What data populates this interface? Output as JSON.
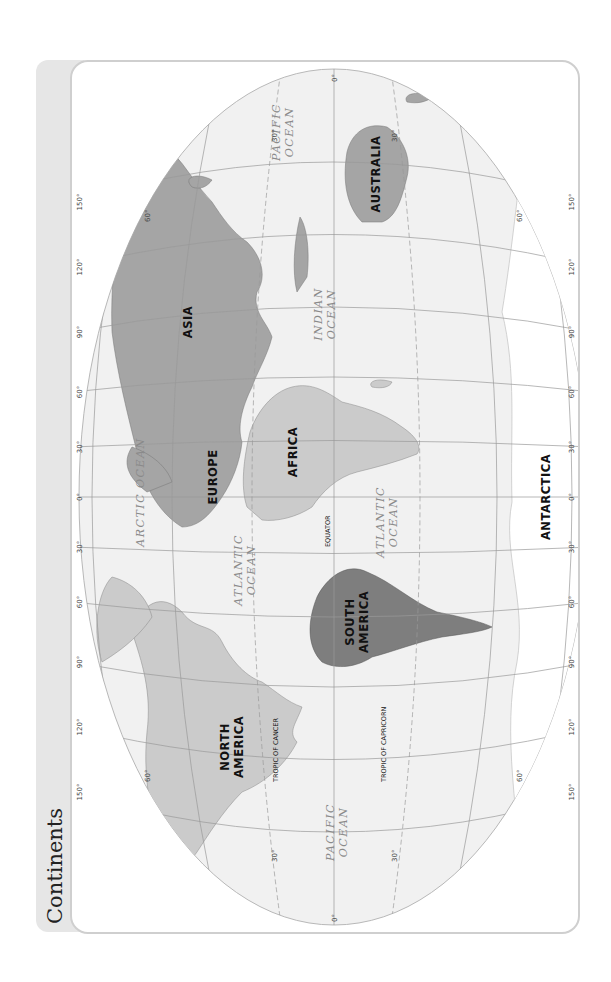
{
  "header": {
    "title": "Continents"
  },
  "colors": {
    "tab_background": "#e6e6e6",
    "panel_border": "#cfcfcf",
    "ocean": "#f1f1f1",
    "graticule": "#9a9a9a",
    "asia_europe_australia": "#a5a5a5",
    "north_america_africa": "#cbcbcb",
    "south_america": "#7e7e7e",
    "antarctica": "#ffffff"
  },
  "map": {
    "orientation": "rotated 90 degrees counter-clockwise (north points left)",
    "continents": [
      {
        "name": "NORTH AMERICA",
        "line1": "NORTH",
        "line2": "AMERICA"
      },
      {
        "name": "SOUTH AMERICA",
        "line1": "SOUTH",
        "line2": "AMERICA"
      },
      {
        "name": "EUROPE"
      },
      {
        "name": "AFRICA"
      },
      {
        "name": "ASIA"
      },
      {
        "name": "AUSTRALIA"
      },
      {
        "name": "ANTARCTICA"
      }
    ],
    "oceans": {
      "arctic": "ARCTIC OCEAN",
      "atlantic_north": {
        "line1": "ATLANTIC",
        "line2": "OCEAN"
      },
      "atlantic_south": {
        "line1": "ATLANTIC",
        "line2": "OCEAN"
      },
      "pacific_east": {
        "line1": "PACIFIC",
        "line2": "OCEAN"
      },
      "pacific_west": {
        "line1": "PACIFIC",
        "line2": "OCEAN"
      },
      "indian": {
        "line1": "INDIAN",
        "line2": "OCEAN"
      }
    },
    "lines": {
      "equator": "EQUATOR",
      "tropic_cancer": "TROPIC OF CANCER",
      "tropic_capricorn": "TROPIC OF CAPRICORN"
    },
    "longitude_ticks_north": [
      "150°",
      "120°",
      "90°",
      "60°",
      "30°",
      "0°",
      "30°",
      "60°",
      "90°",
      "120°",
      "150°"
    ],
    "longitude_ticks_south": [
      "150°",
      "120°",
      "90°",
      "60°",
      "30°",
      "0°",
      "30°",
      "60°",
      "90°",
      "120°",
      "150°"
    ],
    "latitude_ticks": {
      "west": [
        "0°",
        "30°",
        "60°"
      ],
      "east": [
        "0°",
        "30°",
        "60°"
      ],
      "north_edge_w": "60°",
      "north_edge_w30": "30°",
      "south_edge_w": "60°",
      "south_edge_w30": "30°"
    }
  }
}
